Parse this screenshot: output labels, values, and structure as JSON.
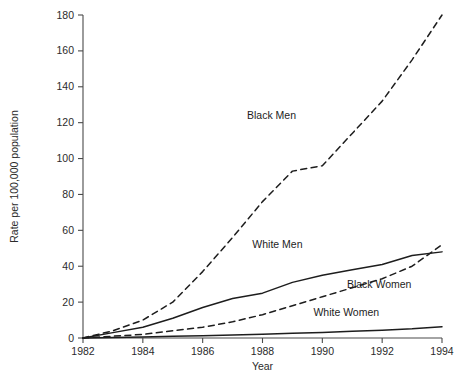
{
  "chart_data": {
    "type": "line",
    "title": "",
    "xlabel": "Year",
    "ylabel": "Rate per 100,000 population",
    "xlim": [
      1982,
      1994
    ],
    "ylim": [
      0,
      180
    ],
    "grid": false,
    "legend_position": "inline-annotations",
    "x_ticks": [
      "1982",
      "1984",
      "1986",
      "1988",
      "1990",
      "1992",
      "1994"
    ],
    "y_ticks": [
      "0",
      "20",
      "40",
      "60",
      "80",
      "100",
      "120",
      "140",
      "160",
      "180"
    ],
    "x": [
      1982,
      1983,
      1984,
      1985,
      1986,
      1987,
      1988,
      1989,
      1990,
      1991,
      1992,
      1993,
      1994
    ],
    "series": [
      {
        "name": "Black Men",
        "style": "dashed",
        "label": "Black Men",
        "values": [
          0,
          4,
          10,
          20,
          37,
          56,
          76,
          93,
          96,
          114,
          132,
          155,
          180
        ]
      },
      {
        "name": "White Men",
        "style": "solid",
        "label": "White Men",
        "values": [
          0,
          3,
          6,
          11,
          17,
          22,
          25,
          31,
          35,
          38,
          41,
          46,
          48
        ]
      },
      {
        "name": "Black Women",
        "style": "dashed",
        "label": "Black Women",
        "values": [
          0,
          1,
          2,
          4,
          6,
          9,
          13,
          18,
          23,
          28,
          33,
          40,
          52
        ]
      },
      {
        "name": "White Women",
        "style": "solid",
        "label": "White Women",
        "values": [
          0,
          0.3,
          0.6,
          1.0,
          1.3,
          1.7,
          2.1,
          2.6,
          3.1,
          3.7,
          4.3,
          5.1,
          6.3
        ]
      }
    ],
    "annotations": [
      {
        "text": "Black Men",
        "x": 1988.3,
        "y": 122
      },
      {
        "text": "White Men",
        "x": 1988.5,
        "y": 50
      },
      {
        "text": "Black Women",
        "x": 1991.9,
        "y": 28
      },
      {
        "text": "White Women",
        "x": 1990.8,
        "y": 12
      }
    ],
    "colors": {
      "line": "#1d1d1d",
      "axis": "#4a4a4a",
      "text": "#2b2b2b",
      "background": "#ffffff"
    }
  }
}
